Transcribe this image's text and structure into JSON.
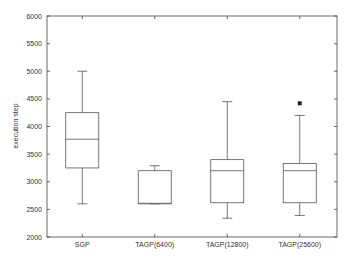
{
  "chart_data": {
    "type": "box",
    "title": "",
    "xlabel": "",
    "ylabel": "execution step",
    "ylim": [
      2000,
      6000
    ],
    "yticks": [
      2000,
      2500,
      3000,
      3500,
      4000,
      4500,
      5000,
      5500,
      6000
    ],
    "grid": false,
    "categories": [
      "SGP",
      "TAGP(6400)",
      "TAGP(12800)",
      "TAGP(25600)"
    ],
    "series": [
      {
        "name": "SGP",
        "whisker_low": 2600,
        "q1": 3250,
        "median": 3770,
        "q3": 4250,
        "whisker_high": 5000,
        "outliers": []
      },
      {
        "name": "TAGP(6400)",
        "whisker_low": 2600,
        "q1": 2600,
        "median": 2610,
        "q3": 3200,
        "whisker_high": 3290,
        "outliers": []
      },
      {
        "name": "TAGP(12800)",
        "whisker_low": 2340,
        "q1": 2620,
        "median": 3200,
        "q3": 3400,
        "whisker_high": 4450,
        "outliers": []
      },
      {
        "name": "TAGP(25600)",
        "whisker_low": 2390,
        "q1": 2620,
        "median": 3200,
        "q3": 3330,
        "whisker_high": 4200,
        "outliers": [
          4420
        ]
      }
    ]
  }
}
